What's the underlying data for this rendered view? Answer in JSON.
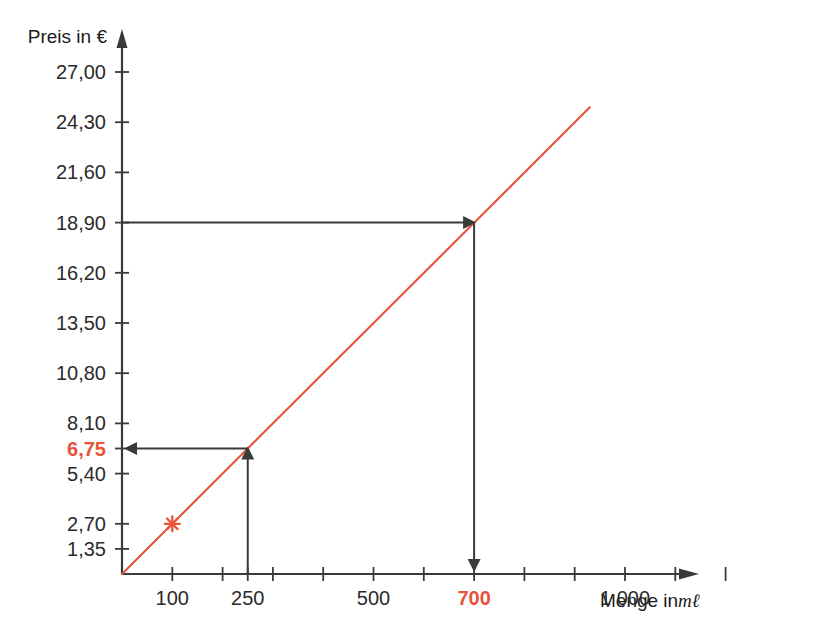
{
  "chart_data": {
    "type": "line",
    "title": "",
    "xlabel": "Menge in",
    "xlabel_unit": "mℓ",
    "ylabel": "Preis in €",
    "x": [
      0,
      1000
    ],
    "y": [
      0,
      27
    ],
    "xlim": [
      0,
      1300
    ],
    "ylim": [
      0,
      29.7
    ],
    "grid": false,
    "legend": false,
    "unit_price_per_100ml": 2.7,
    "series": [
      {
        "name": "Preis",
        "type": "line",
        "color": "#E8533A",
        "points": [
          [
            0,
            0
          ],
          [
            930,
            25.1
          ]
        ]
      }
    ],
    "markers": [
      {
        "name": "reference-point",
        "shape": "star",
        "color": "#E8533A",
        "x": 100,
        "y": 2.7,
        "x_label": "100",
        "y_label": "2,70"
      }
    ],
    "annotations": [
      {
        "name": "read-off-250-to-675",
        "from_x": 250,
        "from_y": 0,
        "to_y": 6.75,
        "x_label": "250",
        "y_label": "6,75",
        "direction": "up-then-left",
        "color": "#E8533A"
      },
      {
        "name": "read-off-1890-to-700",
        "from_y": 18.9,
        "to_x": 700,
        "x_label": "700",
        "y_label": "18,90",
        "direction": "right-then-down",
        "color": "#E8533A"
      }
    ],
    "y_ticks": [
      {
        "value": 1.35,
        "label": "1,35",
        "highlight": false
      },
      {
        "value": 2.7,
        "label": "2,70",
        "highlight": false
      },
      {
        "value": 4.05,
        "label": "",
        "highlight": false
      },
      {
        "value": 5.4,
        "label": "5,40",
        "highlight": false
      },
      {
        "value": 6.75,
        "label": "6,75",
        "highlight": true
      },
      {
        "value": 8.1,
        "label": "8,10",
        "highlight": false
      },
      {
        "value": 9.45,
        "label": "",
        "highlight": false
      },
      {
        "value": 10.8,
        "label": "10,80",
        "highlight": false
      },
      {
        "value": 12.15,
        "label": "",
        "highlight": false
      },
      {
        "value": 13.5,
        "label": "13,50",
        "highlight": false
      },
      {
        "value": 14.85,
        "label": "",
        "highlight": false
      },
      {
        "value": 16.2,
        "label": "16,20",
        "highlight": false
      },
      {
        "value": 17.55,
        "label": "",
        "highlight": false
      },
      {
        "value": 18.9,
        "label": "18,90",
        "highlight": false
      },
      {
        "value": 20.25,
        "label": "",
        "highlight": false
      },
      {
        "value": 21.6,
        "label": "21,60",
        "highlight": false
      },
      {
        "value": 22.95,
        "label": "",
        "highlight": false
      },
      {
        "value": 24.3,
        "label": "24,30",
        "highlight": false
      },
      {
        "value": 25.65,
        "label": "",
        "highlight": false
      },
      {
        "value": 27.0,
        "label": "27,00",
        "highlight": false
      }
    ],
    "x_ticks": [
      {
        "value": 100,
        "label": "100",
        "highlight": false
      },
      {
        "value": 200,
        "label": "",
        "highlight": false
      },
      {
        "value": 250,
        "label": "250",
        "highlight": false
      },
      {
        "value": 300,
        "label": "",
        "highlight": false
      },
      {
        "value": 400,
        "label": "",
        "highlight": false
      },
      {
        "value": 500,
        "label": "500",
        "highlight": false
      },
      {
        "value": 600,
        "label": "",
        "highlight": false
      },
      {
        "value": 700,
        "label": "700",
        "highlight": true
      },
      {
        "value": 800,
        "label": "",
        "highlight": false
      },
      {
        "value": 900,
        "label": "",
        "highlight": false
      },
      {
        "value": 1000,
        "label": "1 000",
        "highlight": false
      },
      {
        "value": 1100,
        "label": "",
        "highlight": false
      },
      {
        "value": 1200,
        "label": "",
        "highlight": false
      }
    ],
    "colors": {
      "line": "#E8533A",
      "highlight_text": "#E8533A",
      "axis": "#3a3a3a",
      "annotation": "#3a3a3a",
      "tick_text": "#2b2b2b",
      "background": "#ffffff"
    }
  },
  "axes": {
    "y_title": "Preis in €",
    "x_title": "Menge in",
    "x_title_unit": "mℓ"
  }
}
